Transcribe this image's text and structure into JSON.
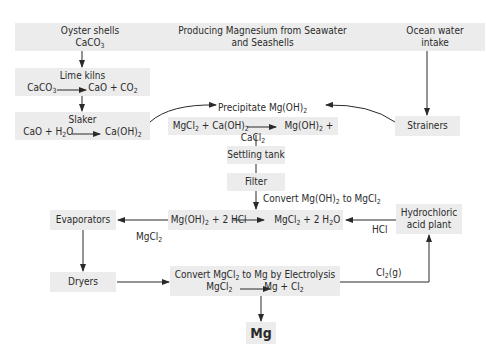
{
  "title": {
    "line1": "Producing Magnesium from Seawater",
    "line2": "and Seashells"
  },
  "nodes": {
    "oyster": {
      "label": "Oyster shells",
      "formula": "CaCO",
      "sub": "3"
    },
    "lime_kilns": {
      "label": "Lime kilns",
      "eq": {
        "a": "CaCO",
        "a_sub": "3",
        "b": "CaO + CO",
        "b_sub": "2"
      }
    },
    "slaker": {
      "label": "Slaker",
      "eq": {
        "a": "CaO + H",
        "a_sub": "2",
        "a2": "O",
        "b": "Ca(OH)",
        "b_sub": "2"
      }
    },
    "ocean": {
      "label1": "Ocean water",
      "label2": "intake"
    },
    "strainers": {
      "label": "Strainers"
    },
    "precipitate": {
      "label": "Precipitate Mg(OH)",
      "sub": "2"
    },
    "precip_eq": {
      "p1": "MgCl",
      "s1": "2",
      "p2": " + Ca(OH)",
      "s2": "2",
      "p3": "Mg(OH)",
      "s3": "2",
      "p4": " + CaCl",
      "s4": "2"
    },
    "settling": {
      "label": "Settling tank"
    },
    "filter": {
      "label": "Filter"
    },
    "convert_label": {
      "p1": "Convert Mg(OH)",
      "s1": "2",
      "p2": " to MgCl",
      "s2": "2"
    },
    "hcl_eq": {
      "p1": "Mg(OH)",
      "s1": "2",
      "p2": " + 2 HCl",
      "p3": "MgCl",
      "s3": "2",
      "p4": " + 2 H",
      "s4": "2",
      "p5": "O"
    },
    "evaporators": {
      "label": "Evaporators"
    },
    "mgcl2_flow": {
      "p": "MgCl",
      "s": "2"
    },
    "hcl_plant": {
      "label1": "Hydrochloric",
      "label2": "acid plant"
    },
    "hcl_flow": {
      "label": "HCl"
    },
    "dryers": {
      "label": "Dryers"
    },
    "electrolysis": {
      "p1": "Convert MgCl",
      "s1": "2",
      "p2": " to Mg by Electrolysis",
      "e1": "MgCl",
      "es1": "2",
      "e2": "Mg + Cl",
      "es2": "2"
    },
    "cl2_flow": {
      "p": "Cl",
      "s": "2",
      "p2": "(g)"
    },
    "product": {
      "label": "Mg"
    }
  },
  "colors": {
    "box": "#ececec",
    "line": "#2a2a2a"
  }
}
